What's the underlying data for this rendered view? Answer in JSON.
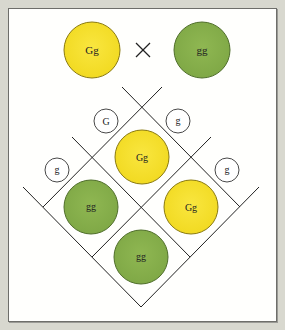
{
  "diagram": {
    "type": "punnett-square",
    "colors": {
      "background": "#d8d8cf",
      "panel": "#fffffd",
      "yellow": "#f5df2e",
      "yellow_stroke": "#8a7a10",
      "green": "#86b04a",
      "green_stroke": "#4f6e2a",
      "line": "#222222"
    },
    "parents": {
      "left": {
        "genotype": "Gg",
        "color": "yellow"
      },
      "cross_symbol": "×",
      "right": {
        "genotype": "gg",
        "color": "green"
      }
    },
    "gametes": {
      "parent1": [
        {
          "allele": "G"
        },
        {
          "allele": "g"
        }
      ],
      "parent2": [
        {
          "allele": "g"
        },
        {
          "allele": "g"
        }
      ]
    },
    "offspring": [
      {
        "position": "top",
        "genotype": "Gg",
        "color": "yellow"
      },
      {
        "position": "left",
        "genotype": "gg",
        "color": "green"
      },
      {
        "position": "right",
        "genotype": "Gg",
        "color": "yellow"
      },
      {
        "position": "bottom",
        "genotype": "gg",
        "color": "green"
      }
    ]
  }
}
